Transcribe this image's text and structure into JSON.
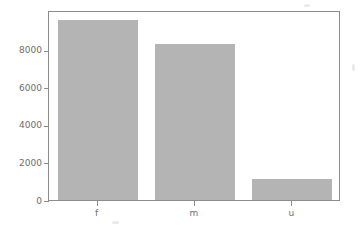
{
  "chart_data": {
    "type": "bar",
    "title": "",
    "xlabel": "",
    "ylabel": "",
    "categories": [
      "f",
      "m",
      "u"
    ],
    "values": [
      9600,
      8320,
      1120
    ],
    "series": [
      {
        "name": "count",
        "values": [
          9600,
          8320,
          1120
        ]
      }
    ],
    "ylim": [
      0,
      10133
    ],
    "xlim": [
      0,
      3
    ],
    "yticks": [
      0,
      2000,
      4000,
      6000,
      8000
    ],
    "ytick_labels": [
      "0",
      "2000",
      "4000",
      "6000",
      "8000"
    ],
    "xtick_labels": [
      "f",
      "m",
      "u"
    ],
    "grid": false,
    "legend": null,
    "legend_position": "none",
    "bar_color": "#b4b4b4",
    "axis_color": "#8c8c8c",
    "text_color": "#6e6e6e",
    "background_color": "#ffffff",
    "annotations": []
  },
  "figure": {
    "width": 363,
    "height": 229,
    "frame": {
      "left": 48,
      "top": 11,
      "right": 340,
      "bottom": 201
    }
  }
}
